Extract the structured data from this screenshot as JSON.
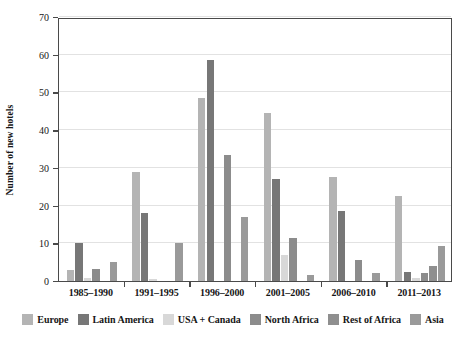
{
  "chart_data": {
    "type": "bar",
    "title": "",
    "subtitle": "",
    "xlabel": "",
    "ylabel": "Number of new hotels",
    "ylim": [
      0,
      70
    ],
    "ytick_step": 10,
    "yticks": [
      0,
      10,
      20,
      30,
      40,
      50,
      60,
      70
    ],
    "grid": true,
    "legend_position": "bottom",
    "categories": [
      "1985–1990",
      "1991–1995",
      "1996–2000",
      "2001–2005",
      "2006–2010",
      "2011–2013"
    ],
    "series": [
      {
        "name": "Europe",
        "color": "#b4b4b4",
        "values": [
          3,
          29,
          48.5,
          44.5,
          27.5,
          22.5
        ]
      },
      {
        "name": "Latin America",
        "color": "#777777",
        "values": [
          10,
          18,
          58.5,
          27,
          18.5,
          2.5
        ]
      },
      {
        "name": "USA + Canada",
        "color": "#d8d8d8",
        "values": [
          0.8,
          0.6,
          0,
          7,
          0,
          0.8
        ]
      },
      {
        "name": "North Africa",
        "color": "#8c8c8c",
        "values": [
          3.2,
          0,
          33.5,
          11.5,
          5.5,
          2.2
        ]
      },
      {
        "name": "Rest of Africa",
        "color": "#8f8f8f",
        "values": [
          0,
          0,
          0,
          0,
          0,
          4
        ]
      },
      {
        "name": "Asia",
        "color": "#9a9a9a",
        "values": [
          5,
          10,
          17,
          1.5,
          2,
          9.2
        ]
      }
    ]
  },
  "axis": {
    "y_title": "Number of new hotels"
  },
  "legend": {
    "items": [
      {
        "label": "Europe",
        "color": "#b4b4b4"
      },
      {
        "label": "Latin America",
        "color": "#777777"
      },
      {
        "label": "USA + Canada",
        "color": "#d8d8d8"
      },
      {
        "label": "North Africa",
        "color": "#8c8c8c"
      },
      {
        "label": "Rest of Africa",
        "color": "#8f8f8f"
      },
      {
        "label": "Asia",
        "color": "#9a9a9a"
      }
    ]
  }
}
